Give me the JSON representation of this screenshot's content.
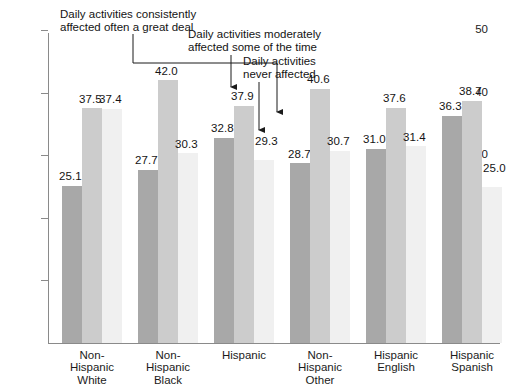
{
  "chart_data": {
    "type": "bar",
    "title": "",
    "xlabel": "",
    "ylabel": "",
    "ylim": [
      0,
      50
    ],
    "yticks": [
      10,
      20,
      30,
      40,
      50
    ],
    "grid": false,
    "legend_position": "none",
    "categories": [
      "Non-\nHispanic\nWhite",
      "Non-\nHispanic\nBlack",
      "Hispanic",
      "Non-\nHispanic\nOther",
      "Hispanic\nEnglish",
      "Hispanic\nSpanish"
    ],
    "series": [
      {
        "name": "Daily activities consistently affected often a great deal",
        "color": "#a8a8a8",
        "values": [
          25.1,
          27.7,
          32.8,
          28.7,
          31.0,
          36.3
        ]
      },
      {
        "name": "Daily activities moderately affected some of the time",
        "color": "#cccccc",
        "values": [
          37.5,
          42.0,
          37.9,
          40.6,
          37.6,
          38.7
        ]
      },
      {
        "name": "Daily activities never affected",
        "color": "#f0f0f0",
        "values": [
          37.4,
          30.3,
          29.3,
          30.7,
          31.4,
          25.0
        ]
      }
    ],
    "annotations": [
      {
        "id": "anno-consistently",
        "text": "Daily activities consistently\naffected often a great deal",
        "points_to": "Hispanic / consistently-affected bar (32.8)"
      },
      {
        "id": "anno-moderately",
        "text": "Daily activities moderately\naffected some of the time",
        "points_to": "Hispanic / moderately-affected bar (37.9)"
      },
      {
        "id": "anno-never",
        "text": "Daily activities\nnever affected",
        "points_to": "Hispanic / never-affected bar (29.3)"
      }
    ],
    "value_labels": {
      "g0": [
        "25.1",
        "37.5",
        "37.4"
      ],
      "g1": [
        "27.7",
        "42.0",
        "30.3"
      ],
      "g2": [
        "32.8",
        "37.9",
        "29.3"
      ],
      "g3": [
        "28.7",
        "40.6",
        "30.7"
      ],
      "g4": [
        "31.0",
        "37.6",
        "31.4"
      ],
      "g5": [
        "36.3",
        "38.7",
        "25.0"
      ]
    },
    "ytick_labels": [
      "10",
      "20",
      "30",
      "40",
      "50"
    ]
  }
}
